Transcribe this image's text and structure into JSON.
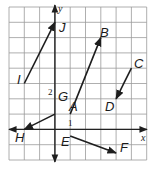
{
  "diagram": {
    "type": "coordinate-grid-vectors",
    "axes": {
      "x_label": "x",
      "y_label": "y",
      "tick_labels": [
        {
          "axis": "y",
          "value": "2"
        },
        {
          "axis": "x",
          "value": "1"
        }
      ]
    },
    "grid": {
      "x_min": -3,
      "x_max": 6,
      "y_min": -2,
      "y_max": 8
    },
    "colors": {
      "grid": "#9a9a9a",
      "axis": "#222222",
      "vector": "#1e1e1e",
      "label": "#1a1a1a"
    },
    "vectors": [
      {
        "name": "IJ",
        "tail": "I",
        "head": "J"
      },
      {
        "name": "AB",
        "tail": "A",
        "head": "B"
      },
      {
        "name": "CD",
        "tail": "C",
        "head": "D"
      },
      {
        "name": "GH",
        "tail": "G",
        "head": "H"
      },
      {
        "name": "EF",
        "tail": "E",
        "head": "F"
      }
    ],
    "points": {
      "I": "I",
      "J": "J",
      "A": "A",
      "B": "B",
      "C": "C",
      "D": "D",
      "G": "G",
      "H": "H",
      "E": "E",
      "F": "F"
    }
  }
}
